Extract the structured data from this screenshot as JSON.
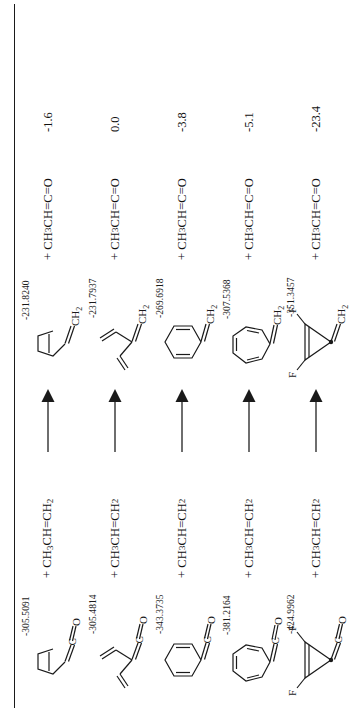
{
  "figure": {
    "type": "reaction-scheme",
    "orientation": "rotated-90-ccw",
    "rule_visible": true,
    "units_note": "energies in hartree (absolute) and kcal/mol (relative)"
  },
  "columns": {
    "reactant": "ketene",
    "coreactant": "propene",
    "arrow": "reaction-arrow",
    "product": "methylene compound",
    "byproduct": "methylketene",
    "relative_energy": "relative energy"
  },
  "coreactant_label": "+ CH3CH=CH2",
  "byproduct_label": "+ CH3CH=C=O",
  "reactions": [
    {
      "id": "cyclopentene-ketene",
      "reactant": {
        "name": "cyclopentenylidene-ketene",
        "skeleton": "cyclopentene",
        "top_group": "C=O",
        "energy": "-305.5091"
      },
      "product": {
        "name": "methylene-cyclopentene",
        "skeleton": "cyclopentene",
        "top_group": "CH2",
        "energy": "-231.8240"
      },
      "delta_e": "-1.6"
    },
    {
      "id": "divinyl-ketene",
      "reactant": {
        "name": "divinyl-ketene",
        "skeleton": "divinyl",
        "top_group": "C=O",
        "energy": "-305.4814"
      },
      "product": {
        "name": "divinyl-methylene",
        "skeleton": "divinyl",
        "top_group": "CH2",
        "energy": "-231.7937"
      },
      "delta_e": "0.0"
    },
    {
      "id": "cyclohexadiene-ketene",
      "reactant": {
        "name": "cyclohexadienylidene-ketene",
        "skeleton": "cyclohexadiene",
        "top_group": "C=O",
        "energy": "-343.3735"
      },
      "product": {
        "name": "methylene-cyclohexadiene",
        "skeleton": "cyclohexadiene",
        "top_group": "CH2",
        "energy": "-269.6918"
      },
      "delta_e": "-3.8"
    },
    {
      "id": "cycloheptatriene-ketene",
      "reactant": {
        "name": "cycloheptatrienylidene-ketene",
        "skeleton": "cycloheptatriene",
        "top_group": "C=O",
        "energy": "-381.2164"
      },
      "product": {
        "name": "methylene-cycloheptatriene",
        "skeleton": "cycloheptatriene",
        "top_group": "CH2",
        "energy": "-307.5368"
      },
      "delta_e": "-5.1"
    },
    {
      "id": "difluorocyclopropene-ketene",
      "reactant": {
        "name": "difluorocyclopropenylidene-ketene",
        "skeleton": "difluorocyclopropene",
        "top_group": "C=O",
        "substituents": [
          "F",
          "F"
        ],
        "energy": "-424.9962"
      },
      "product": {
        "name": "methylene-difluorocyclopropene",
        "skeleton": "difluorocyclopropene",
        "top_group": "CH2",
        "substituents": [
          "F",
          "F"
        ],
        "energy": "-351.3457"
      },
      "delta_e": "-23.4"
    }
  ],
  "atom_labels": {
    "carbon": "C",
    "oxygen": "O",
    "fluorine": "F",
    "methylene": "CH2"
  },
  "colors": {
    "ink": "#1a1a1a",
    "background": "#ffffff"
  }
}
